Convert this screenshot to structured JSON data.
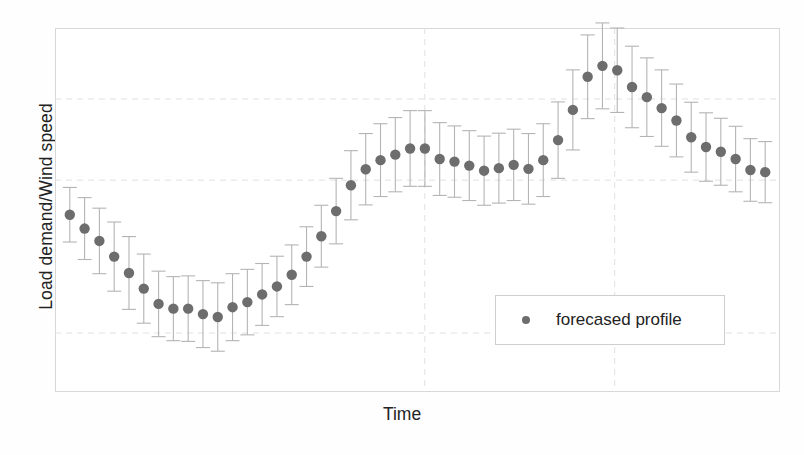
{
  "chart_data": {
    "type": "scatter",
    "title": "",
    "subtitle": "",
    "xlabel": "Time",
    "ylabel": "Load demand/Wind speed",
    "legend": [
      {
        "label": "forecased profile",
        "marker": "circle",
        "color": "#6d6d6d"
      }
    ],
    "legend_position": "center-right inside plot",
    "grid": true,
    "grid_x": [
      0.51,
      0.772
    ],
    "grid_y": [
      0.195,
      0.418,
      0.838
    ],
    "axis_ticks_visible": false,
    "xlim": [
      0,
      49
    ],
    "ylim": [
      0,
      1
    ],
    "x": [
      1,
      2,
      3,
      4,
      5,
      6,
      7,
      8,
      9,
      10,
      11,
      12,
      13,
      14,
      15,
      16,
      17,
      18,
      19,
      20,
      21,
      22,
      23,
      24,
      25,
      26,
      27,
      28,
      29,
      30,
      31,
      32,
      33,
      34,
      35,
      36,
      37,
      38,
      39,
      40,
      41,
      42,
      43,
      44,
      45,
      46,
      47,
      48
    ],
    "series": [
      {
        "name": "forecased profile",
        "color": "#6d6d6d",
        "marker": "circle",
        "values": [
          0.487,
          0.449,
          0.415,
          0.372,
          0.327,
          0.284,
          0.242,
          0.229,
          0.229,
          0.214,
          0.206,
          0.233,
          0.247,
          0.268,
          0.29,
          0.322,
          0.372,
          0.428,
          0.497,
          0.568,
          0.612,
          0.637,
          0.652,
          0.669,
          0.669,
          0.64,
          0.633,
          0.622,
          0.608,
          0.615,
          0.624,
          0.613,
          0.637,
          0.692,
          0.775,
          0.866,
          0.896,
          0.884,
          0.838,
          0.81,
          0.78,
          0.746,
          0.7,
          0.673,
          0.66,
          0.64,
          0.61,
          0.604
        ],
        "error_low": [
          0.075,
          0.085,
          0.09,
          0.095,
          0.1,
          0.095,
          0.09,
          0.088,
          0.09,
          0.092,
          0.094,
          0.092,
          0.09,
          0.085,
          0.083,
          0.082,
          0.082,
          0.085,
          0.09,
          0.095,
          0.098,
          0.1,
          0.102,
          0.104,
          0.104,
          0.1,
          0.098,
          0.096,
          0.095,
          0.096,
          0.098,
          0.097,
          0.1,
          0.105,
          0.11,
          0.115,
          0.118,
          0.116,
          0.112,
          0.108,
          0.105,
          0.1,
          0.096,
          0.094,
          0.092,
          0.09,
          0.086,
          0.084
        ],
        "error_high": [
          0.075,
          0.085,
          0.09,
          0.095,
          0.1,
          0.095,
          0.09,
          0.088,
          0.09,
          0.092,
          0.094,
          0.092,
          0.09,
          0.085,
          0.083,
          0.082,
          0.082,
          0.085,
          0.09,
          0.095,
          0.098,
          0.1,
          0.102,
          0.104,
          0.104,
          0.1,
          0.098,
          0.096,
          0.095,
          0.096,
          0.098,
          0.097,
          0.1,
          0.105,
          0.11,
          0.115,
          0.118,
          0.116,
          0.112,
          0.108,
          0.105,
          0.1,
          0.096,
          0.094,
          0.092,
          0.09,
          0.086,
          0.084
        ]
      }
    ]
  },
  "style": {
    "marker_color": "#6d6d6d",
    "errorbar_color": "#b4b4b4",
    "frame_color": "#d7d7d7",
    "grid_color": "#e0e0e0",
    "background": "#ffffff",
    "text_color": "#232323"
  }
}
